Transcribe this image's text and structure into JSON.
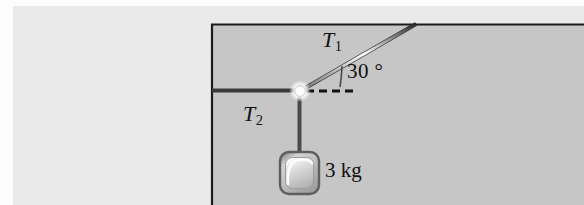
{
  "figure": {
    "colors": {
      "outer_background": "#ececec",
      "panel_background": "#c8c8c8",
      "line_dark": "#1a1a1a",
      "rope_highlight": "#ffffff",
      "block_fill": "#c3c3c3",
      "block_border": "#6e6e6e",
      "knot_fill": "#ffffff"
    },
    "labels": {
      "tension_upper": "T",
      "tension_upper_sub": "1",
      "tension_lower": "T",
      "tension_lower_sub": "2",
      "angle": "30 °",
      "mass": "3 kg"
    },
    "geometry": {
      "panel_left_x": 211,
      "ceiling_y": 24,
      "knot_x": 300,
      "knot_y": 91,
      "ceiling_anchor_x": 416,
      "wall_anchor_x": 212,
      "block_center_x": 299,
      "block_top_y": 152,
      "block_size": 39,
      "angle_degrees": 30,
      "dashed_line_end_x": 356
    }
  }
}
